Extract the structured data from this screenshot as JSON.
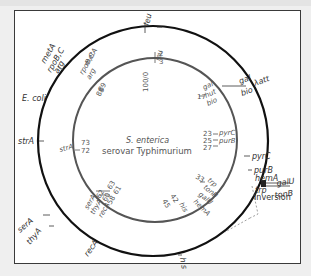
{
  "diagram": {
    "outer_label": "E. coli",
    "inner_label_line1": "S. enterica",
    "inner_label_line2": "serovar Typhimurium",
    "inversion_label": "Inversion",
    "colors": {
      "outer_circle": "#111111",
      "inner_circle": "#555555",
      "text": "#333333",
      "background": "#ffffff",
      "page": "#efefef"
    },
    "outer_genes": {
      "leu": "leu",
      "metA": "metA",
      "rpoBC": "rpoB,C",
      "arg": "arg",
      "gal": "gal",
      "lambda_att": "λatt",
      "bio": "bio",
      "pyrC": "pyrC",
      "purB": "purB",
      "hemA": "hemA",
      "trp": "trp",
      "galU": "galU",
      "tonB": "tonB",
      "strA": "strA",
      "serA": "serA",
      "thyA": "thyA",
      "recA": "recA",
      "his": "his"
    },
    "inner_genes": {
      "leu": "leu",
      "metA": "metA",
      "rpoBC": "rpoB,C",
      "arg": "arg",
      "gal": "gal",
      "hut": "hut",
      "bio": "bio",
      "pyrC": "pyrC",
      "purB": "purB",
      "trp": "trp",
      "tonB": "tonB",
      "galU": "galU",
      "hemA": "hemA",
      "his": "his",
      "strA": "strA",
      "serA": "serA",
      "thyA": "thyA",
      "recA": "recA"
    },
    "inner_positions": {
      "p100": "100/0",
      "p2": "2",
      "p3": "3",
      "p17": "17",
      "p23": "23",
      "p25": "25",
      "p27": "27",
      "p33": "33",
      "p42": "42",
      "p45": "45",
      "p58": "58",
      "p60": "60",
      "p61": "61",
      "p62": "62",
      "p63": "63",
      "p72": "72",
      "p73": "73",
      "p88": "88",
      "p89": "89"
    }
  }
}
